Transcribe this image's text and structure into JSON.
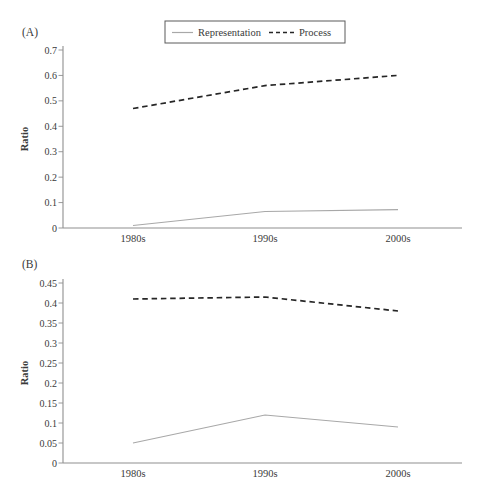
{
  "figure": {
    "background": "#ffffff"
  },
  "legend": {
    "items": [
      {
        "label": "Representation",
        "line_style": "solid",
        "color": "#a8a8a8"
      },
      {
        "label": "Process",
        "line_style": "dashed",
        "color": "#262626"
      }
    ]
  },
  "colors": {
    "axis": "#8f8f8f",
    "text": "#3a3a3a",
    "background": "#ffffff",
    "representation_line": "#a8a8a8",
    "process_line": "#262626",
    "legend_border": "#5a5a5a"
  },
  "chart_data": [
    {
      "panel_label": "(A)",
      "type": "line",
      "categories": [
        "1980s",
        "1990s",
        "2000s"
      ],
      "series": [
        {
          "name": "Representation",
          "values": [
            0.01,
            0.065,
            0.072
          ],
          "line_style": "solid",
          "color": "#a8a8a8"
        },
        {
          "name": "Process",
          "values": [
            0.47,
            0.56,
            0.6
          ],
          "line_style": "dashed",
          "color": "#262626"
        }
      ],
      "xlabel": "",
      "ylabel": "Ratio",
      "ylim": [
        0,
        0.7
      ],
      "ytick_labels": [
        "0",
        "0.1",
        "0.2",
        "0.3",
        "0.4",
        "0.5",
        "0.6",
        "0.7"
      ],
      "grid": false,
      "legend_position": "top-center"
    },
    {
      "panel_label": "(B)",
      "type": "line",
      "categories": [
        "1980s",
        "1990s",
        "2000s"
      ],
      "series": [
        {
          "name": "Representation",
          "values": [
            0.05,
            0.12,
            0.09
          ],
          "line_style": "solid",
          "color": "#a8a8a8"
        },
        {
          "name": "Process",
          "values": [
            0.41,
            0.415,
            0.38
          ],
          "line_style": "dashed",
          "color": "#262626"
        }
      ],
      "xlabel": "",
      "ylabel": "Ratio",
      "ylim": [
        0,
        0.45
      ],
      "ytick_labels": [
        "0",
        "0.05",
        "0.1",
        "0.15",
        "0.2",
        "0.25",
        "0.3",
        "0.35",
        "0.4",
        "0.45"
      ],
      "grid": false,
      "legend_position": "none"
    }
  ]
}
